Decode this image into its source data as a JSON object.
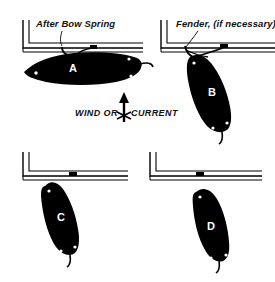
{
  "figure": {
    "background_color": "#ffffff",
    "ink_color": "#000000",
    "letter_color": "#ffffff"
  },
  "annotations": {
    "after_bow_spring": "After Bow Spring",
    "fender": "Fender, (if necessary)",
    "wind_part": "WIND OR",
    "current_part": "CURRENT",
    "arrow_icon": "up-arrow-icon"
  },
  "panels": [
    {
      "id": "A",
      "letter": "A",
      "position": "top-left",
      "dock": "L-shaped pier, double line, opening right",
      "boat_orientation": "horizontal, bow to left, alongside dock",
      "has_callout": true,
      "callout": "After Bow Spring"
    },
    {
      "id": "B",
      "letter": "B",
      "position": "top-right",
      "dock": "L-shaped pier, double line, opening right",
      "boat_orientation": "angled bow-up, stern swung out from dock",
      "has_callout": true,
      "callout": "Fender, (if necessary)"
    },
    {
      "id": "C",
      "letter": "C",
      "position": "bottom-left",
      "dock": "L-shaped pier, double line, opening right",
      "boat_orientation": "steeply angled, bow at dock cleat, stern down-right",
      "has_callout": false,
      "callout": ""
    },
    {
      "id": "D",
      "letter": "D",
      "position": "bottom-right",
      "dock": "L-shaped pier, double line, opening right",
      "boat_orientation": "free of the dock, tilted, clear of pier",
      "has_callout": false,
      "callout": ""
    }
  ]
}
